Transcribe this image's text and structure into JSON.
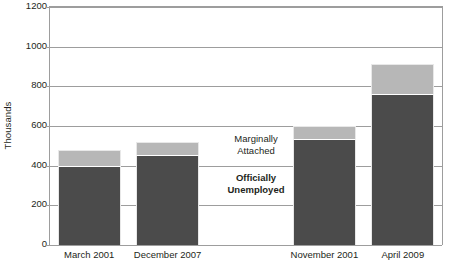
{
  "chart_data": {
    "type": "bar",
    "title": "",
    "subtitle": "",
    "xlabel": "",
    "ylabel": "Thousands",
    "ylim": [
      0,
      1200
    ],
    "ytick_step": 200,
    "ytick_labels": [
      "1200",
      "1000",
      "800",
      "600",
      "400",
      "200",
      "0"
    ],
    "ytick_values": [
      1200,
      1000,
      800,
      600,
      400,
      200,
      0
    ],
    "grid": true,
    "stacked": true,
    "legend_position": "inline-annotation",
    "categories": [
      "March 2001",
      "December 2007",
      "",
      "November 2001",
      "April 2009"
    ],
    "series": [
      {
        "name": "Officially Unemployed",
        "color": "#4b4b4b",
        "values": [
          400,
          455,
          null,
          535,
          760
        ]
      },
      {
        "name": "Marginally Attached",
        "color": "#b7b7b7",
        "values": [
          80,
          65,
          null,
          65,
          155
        ]
      }
    ],
    "totals": [
      480,
      520,
      null,
      600,
      915
    ],
    "annotations": [
      {
        "text": "Marginally\nAttached",
        "bold": false
      },
      {
        "text": "Officially\nUnemployed",
        "bold": true
      }
    ]
  },
  "axis": {
    "y_title": "Thousands",
    "y_ticks": [
      {
        "label": "1200",
        "value": 1200
      },
      {
        "label": "1000",
        "value": 1000
      },
      {
        "label": "800",
        "value": 800
      },
      {
        "label": "600",
        "value": 600
      },
      {
        "label": "400",
        "value": 400
      },
      {
        "label": "200",
        "value": 200
      },
      {
        "label": "0",
        "value": 0
      }
    ],
    "x_ticks": [
      {
        "label": "March 2001"
      },
      {
        "label": "December 2007"
      },
      {
        "label": ""
      },
      {
        "label": "November 2001"
      },
      {
        "label": "April 2009"
      }
    ]
  },
  "annotations": {
    "marginal_line1": "Marginally",
    "marginal_line2": "Attached",
    "official_line1": "Officially",
    "official_line2": "Unemployed"
  },
  "colors": {
    "marginally_attached": "#b7b7b7",
    "officially_unemployed": "#4b4b4b",
    "gridline": "#9d9d9d",
    "text": "#231f20",
    "background": "#ffffff"
  }
}
